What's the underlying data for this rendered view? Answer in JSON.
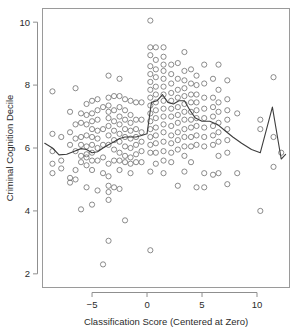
{
  "figure": {
    "background": "#ffffff",
    "panel": {
      "x": 42,
      "y": 8,
      "width": 248,
      "height": 280,
      "border_color": "#9a9a9a"
    }
  },
  "chart_data": {
    "type": "scatter",
    "title": "",
    "xlabel": "Classification Score (Centered at Zero)",
    "ylabel": "Criminal Cognition Decile",
    "xlim": [
      -9.55,
      13.0
    ],
    "ylim": [
      1.55,
      10.45
    ],
    "xticks": [
      -5,
      0,
      5,
      10
    ],
    "xticklabels": [
      "−5",
      "0",
      "5",
      "10"
    ],
    "yticks": [
      2,
      4,
      6,
      8,
      10
    ],
    "yticklabels": [
      "2",
      "4",
      "6",
      "8",
      "10"
    ],
    "grid": false,
    "legend": null,
    "marker": {
      "shape": "open-circle",
      "radius_px": 2.6,
      "stroke": "#6f6f6f",
      "stroke_width": 0.8,
      "fill": "none"
    },
    "series": [
      {
        "name": "Observations",
        "type": "scatter",
        "points": [
          [
            -8.6,
            7.8
          ],
          [
            -8.6,
            6.45
          ],
          [
            -8.6,
            5.9
          ],
          [
            -8.6,
            5.5
          ],
          [
            -8.6,
            5.2
          ],
          [
            -7.8,
            6.35
          ],
          [
            -7.8,
            5.6
          ],
          [
            -7.8,
            5.35
          ],
          [
            -7.0,
            7.15
          ],
          [
            -7.0,
            6.5
          ],
          [
            -7.0,
            6.1
          ],
          [
            -7.0,
            5.05
          ],
          [
            -7.0,
            4.9
          ],
          [
            -6.5,
            7.9
          ],
          [
            -6.5,
            6.75
          ],
          [
            -6.5,
            6.3
          ],
          [
            -6.5,
            5.9
          ],
          [
            -6.5,
            5.3
          ],
          [
            -6.5,
            5.0
          ],
          [
            -6.0,
            7.1
          ],
          [
            -6.0,
            6.8
          ],
          [
            -6.0,
            6.35
          ],
          [
            -6.0,
            6.1
          ],
          [
            -6.0,
            5.75
          ],
          [
            -6.0,
            5.55
          ],
          [
            -6.0,
            4.05
          ],
          [
            -5.5,
            7.4
          ],
          [
            -5.5,
            7.05
          ],
          [
            -5.5,
            6.75
          ],
          [
            -5.5,
            6.4
          ],
          [
            -5.5,
            6.05
          ],
          [
            -5.5,
            5.8
          ],
          [
            -5.5,
            5.7
          ],
          [
            -5.5,
            5.45
          ],
          [
            -5.5,
            4.75
          ],
          [
            -5.0,
            7.5
          ],
          [
            -5.0,
            7.1
          ],
          [
            -5.0,
            6.85
          ],
          [
            -5.0,
            6.6
          ],
          [
            -5.0,
            6.35
          ],
          [
            -5.0,
            6.1
          ],
          [
            -5.0,
            5.85
          ],
          [
            -5.0,
            5.6
          ],
          [
            -5.0,
            5.3
          ],
          [
            -5.0,
            4.2
          ],
          [
            -4.5,
            7.55
          ],
          [
            -4.5,
            7.2
          ],
          [
            -4.5,
            6.9
          ],
          [
            -4.5,
            6.55
          ],
          [
            -4.5,
            6.3
          ],
          [
            -4.5,
            6.0
          ],
          [
            -4.5,
            5.6
          ],
          [
            -4.5,
            4.65
          ],
          [
            -4.0,
            7.3
          ],
          [
            -4.0,
            6.6
          ],
          [
            -4.0,
            6.1
          ],
          [
            -4.0,
            5.7
          ],
          [
            -4.0,
            5.2
          ],
          [
            -4.0,
            2.3
          ],
          [
            -3.5,
            8.3
          ],
          [
            -3.5,
            7.6
          ],
          [
            -3.5,
            7.35
          ],
          [
            -3.5,
            7.15
          ],
          [
            -3.5,
            6.95
          ],
          [
            -3.5,
            6.7
          ],
          [
            -3.5,
            6.4
          ],
          [
            -3.5,
            6.1
          ],
          [
            -3.5,
            5.5
          ],
          [
            -3.5,
            5.1
          ],
          [
            -3.5,
            4.8
          ],
          [
            -3.5,
            4.6
          ],
          [
            -3.5,
            4.35
          ],
          [
            -3.5,
            3.05
          ],
          [
            -3.0,
            7.65
          ],
          [
            -3.0,
            7.2
          ],
          [
            -3.0,
            6.85
          ],
          [
            -3.0,
            6.55
          ],
          [
            -3.0,
            6.25
          ],
          [
            -3.0,
            5.95
          ],
          [
            -3.0,
            5.6
          ],
          [
            -3.0,
            4.75
          ],
          [
            -2.5,
            8.2
          ],
          [
            -2.5,
            7.65
          ],
          [
            -2.5,
            7.3
          ],
          [
            -2.5,
            7.0
          ],
          [
            -2.5,
            6.75
          ],
          [
            -2.5,
            6.45
          ],
          [
            -2.5,
            6.2
          ],
          [
            -2.5,
            5.85
          ],
          [
            -2.5,
            5.6
          ],
          [
            -2.5,
            5.3
          ],
          [
            -2.5,
            4.7
          ],
          [
            -2.0,
            7.55
          ],
          [
            -2.0,
            7.2
          ],
          [
            -2.0,
            6.9
          ],
          [
            -2.0,
            6.6
          ],
          [
            -2.0,
            6.35
          ],
          [
            -2.0,
            6.05
          ],
          [
            -2.0,
            5.75
          ],
          [
            -2.0,
            5.55
          ],
          [
            -2.0,
            3.7
          ],
          [
            -1.5,
            7.5
          ],
          [
            -1.5,
            7.05
          ],
          [
            -1.5,
            6.8
          ],
          [
            -1.5,
            6.55
          ],
          [
            -1.5,
            6.3
          ],
          [
            -1.5,
            6.0
          ],
          [
            -1.5,
            5.7
          ],
          [
            -1.5,
            5.5
          ],
          [
            -1.5,
            5.2
          ],
          [
            -1.0,
            7.45
          ],
          [
            -1.0,
            6.9
          ],
          [
            -1.0,
            6.6
          ],
          [
            -1.0,
            6.35
          ],
          [
            -1.0,
            6.1
          ],
          [
            -1.0,
            5.8
          ],
          [
            -1.0,
            5.55
          ],
          [
            -0.5,
            7.45
          ],
          [
            -0.5,
            6.9
          ],
          [
            -0.5,
            6.5
          ],
          [
            -0.5,
            6.2
          ],
          [
            -0.5,
            5.9
          ],
          [
            -0.5,
            5.55
          ],
          [
            0.3,
            10.05
          ],
          [
            0.3,
            9.2
          ],
          [
            0.3,
            8.95
          ],
          [
            0.3,
            8.6
          ],
          [
            0.3,
            8.35
          ],
          [
            0.3,
            8.1
          ],
          [
            0.3,
            7.85
          ],
          [
            0.3,
            7.6
          ],
          [
            0.3,
            7.35
          ],
          [
            0.3,
            7.1
          ],
          [
            0.3,
            6.85
          ],
          [
            0.3,
            6.6
          ],
          [
            0.3,
            6.35
          ],
          [
            0.3,
            6.1
          ],
          [
            0.3,
            5.85
          ],
          [
            0.3,
            5.25
          ],
          [
            0.3,
            2.75
          ],
          [
            0.8,
            9.2
          ],
          [
            0.8,
            8.8
          ],
          [
            0.8,
            8.5
          ],
          [
            0.8,
            8.25
          ],
          [
            0.8,
            7.95
          ],
          [
            0.8,
            7.7
          ],
          [
            0.8,
            7.45
          ],
          [
            0.8,
            7.2
          ],
          [
            0.8,
            6.95
          ],
          [
            0.8,
            6.65
          ],
          [
            0.8,
            6.4
          ],
          [
            0.8,
            6.15
          ],
          [
            0.8,
            5.85
          ],
          [
            0.8,
            5.5
          ],
          [
            1.5,
            9.2
          ],
          [
            1.5,
            8.9
          ],
          [
            1.5,
            8.65
          ],
          [
            1.5,
            8.45
          ],
          [
            1.5,
            8.2
          ],
          [
            1.5,
            7.95
          ],
          [
            1.5,
            7.7
          ],
          [
            1.5,
            7.5
          ],
          [
            1.5,
            7.25
          ],
          [
            1.5,
            7.0
          ],
          [
            1.5,
            6.75
          ],
          [
            1.5,
            6.5
          ],
          [
            1.5,
            6.2
          ],
          [
            1.5,
            5.9
          ],
          [
            1.5,
            5.6
          ],
          [
            1.5,
            5.2
          ],
          [
            2.2,
            8.65
          ],
          [
            2.2,
            8.35
          ],
          [
            2.2,
            8.05
          ],
          [
            2.2,
            7.75
          ],
          [
            2.2,
            7.5
          ],
          [
            2.2,
            7.25
          ],
          [
            2.2,
            7.0
          ],
          [
            2.2,
            6.7
          ],
          [
            2.2,
            6.4
          ],
          [
            2.2,
            6.15
          ],
          [
            2.2,
            5.85
          ],
          [
            2.2,
            5.55
          ],
          [
            2.8,
            8.7
          ],
          [
            2.8,
            8.2
          ],
          [
            2.8,
            7.85
          ],
          [
            2.8,
            7.6
          ],
          [
            2.8,
            7.3
          ],
          [
            2.8,
            7.05
          ],
          [
            2.8,
            6.8
          ],
          [
            2.8,
            6.5
          ],
          [
            2.8,
            6.25
          ],
          [
            2.8,
            5.95
          ],
          [
            2.8,
            4.8
          ],
          [
            3.4,
            9.05
          ],
          [
            3.4,
            8.45
          ],
          [
            3.4,
            8.15
          ],
          [
            3.4,
            7.9
          ],
          [
            3.4,
            7.65
          ],
          [
            3.4,
            7.4
          ],
          [
            3.4,
            7.15
          ],
          [
            3.4,
            6.9
          ],
          [
            3.4,
            6.6
          ],
          [
            3.4,
            6.35
          ],
          [
            3.4,
            6.05
          ],
          [
            3.4,
            5.75
          ],
          [
            3.4,
            5.25
          ],
          [
            4.0,
            8.5
          ],
          [
            4.0,
            8.05
          ],
          [
            4.0,
            7.7
          ],
          [
            4.0,
            7.45
          ],
          [
            4.0,
            7.15
          ],
          [
            4.0,
            6.9
          ],
          [
            4.0,
            6.65
          ],
          [
            4.0,
            6.35
          ],
          [
            4.0,
            6.05
          ],
          [
            4.0,
            5.55
          ],
          [
            4.5,
            8.3
          ],
          [
            4.5,
            8.0
          ],
          [
            4.5,
            7.7
          ],
          [
            4.5,
            7.45
          ],
          [
            4.5,
            7.2
          ],
          [
            4.5,
            6.95
          ],
          [
            4.5,
            6.7
          ],
          [
            4.5,
            6.4
          ],
          [
            4.5,
            6.1
          ],
          [
            4.5,
            4.75
          ],
          [
            5.2,
            8.65
          ],
          [
            5.2,
            8.05
          ],
          [
            5.2,
            7.6
          ],
          [
            5.2,
            7.25
          ],
          [
            5.2,
            6.95
          ],
          [
            5.2,
            6.65
          ],
          [
            5.2,
            6.35
          ],
          [
            5.2,
            6.05
          ],
          [
            5.2,
            5.2
          ],
          [
            5.2,
            4.75
          ],
          [
            6.0,
            8.2
          ],
          [
            6.0,
            7.6
          ],
          [
            6.0,
            7.3
          ],
          [
            6.0,
            7.0
          ],
          [
            6.0,
            6.7
          ],
          [
            6.0,
            6.4
          ],
          [
            6.0,
            6.1
          ],
          [
            6.0,
            5.15
          ],
          [
            6.5,
            8.65
          ],
          [
            6.5,
            7.85
          ],
          [
            6.5,
            7.45
          ],
          [
            6.5,
            7.15
          ],
          [
            6.5,
            6.8
          ],
          [
            6.5,
            6.5
          ],
          [
            6.5,
            6.2
          ],
          [
            6.5,
            5.75
          ],
          [
            6.5,
            5.2
          ],
          [
            7.3,
            8.15
          ],
          [
            7.3,
            7.55
          ],
          [
            7.3,
            7.2
          ],
          [
            7.3,
            6.9
          ],
          [
            7.3,
            6.6
          ],
          [
            7.3,
            6.25
          ],
          [
            7.3,
            5.85
          ],
          [
            7.3,
            4.85
          ],
          [
            8.2,
            7.1
          ],
          [
            8.2,
            5.2
          ],
          [
            10.3,
            6.9
          ],
          [
            10.3,
            6.6
          ],
          [
            10.3,
            4.0
          ],
          [
            11.5,
            8.25
          ],
          [
            11.5,
            6.35
          ],
          [
            11.5,
            5.4
          ],
          [
            12.2,
            5.85
          ]
        ]
      },
      {
        "name": "Trend",
        "type": "line",
        "color": "#3d3d3d",
        "width": 1.1,
        "points": [
          [
            -9.3,
            6.15
          ],
          [
            -8.6,
            6.0
          ],
          [
            -8.0,
            5.78
          ],
          [
            -7.3,
            5.8
          ],
          [
            -6.6,
            5.9
          ],
          [
            -6.0,
            5.98
          ],
          [
            -5.5,
            5.95
          ],
          [
            -5.0,
            5.85
          ],
          [
            -4.5,
            5.88
          ],
          [
            -4.0,
            6.0
          ],
          [
            -3.5,
            6.1
          ],
          [
            -3.0,
            6.2
          ],
          [
            -2.5,
            6.3
          ],
          [
            -2.0,
            6.35
          ],
          [
            -1.5,
            6.35
          ],
          [
            -1.0,
            6.35
          ],
          [
            -0.5,
            6.4
          ],
          [
            0.0,
            6.45
          ],
          [
            0.4,
            7.45
          ],
          [
            0.9,
            7.5
          ],
          [
            1.4,
            7.7
          ],
          [
            1.9,
            7.45
          ],
          [
            2.4,
            7.4
          ],
          [
            2.9,
            7.5
          ],
          [
            3.4,
            7.5
          ],
          [
            3.9,
            7.2
          ],
          [
            4.4,
            6.95
          ],
          [
            5.0,
            6.85
          ],
          [
            5.7,
            6.85
          ],
          [
            6.4,
            6.75
          ],
          [
            7.1,
            6.55
          ],
          [
            7.8,
            6.35
          ],
          [
            8.6,
            6.15
          ],
          [
            9.5,
            5.95
          ],
          [
            10.3,
            5.85
          ],
          [
            11.4,
            7.3
          ],
          [
            12.2,
            5.65
          ],
          [
            12.6,
            5.8
          ]
        ]
      }
    ]
  }
}
